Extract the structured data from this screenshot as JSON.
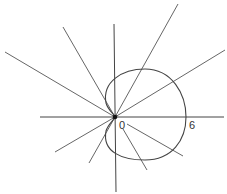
{
  "diagram": {
    "type": "polar-cardioid",
    "labels": {
      "origin": "0",
      "max_radius": "6"
    },
    "colors": {
      "line": "#444444",
      "background": "#ffffff"
    }
  }
}
